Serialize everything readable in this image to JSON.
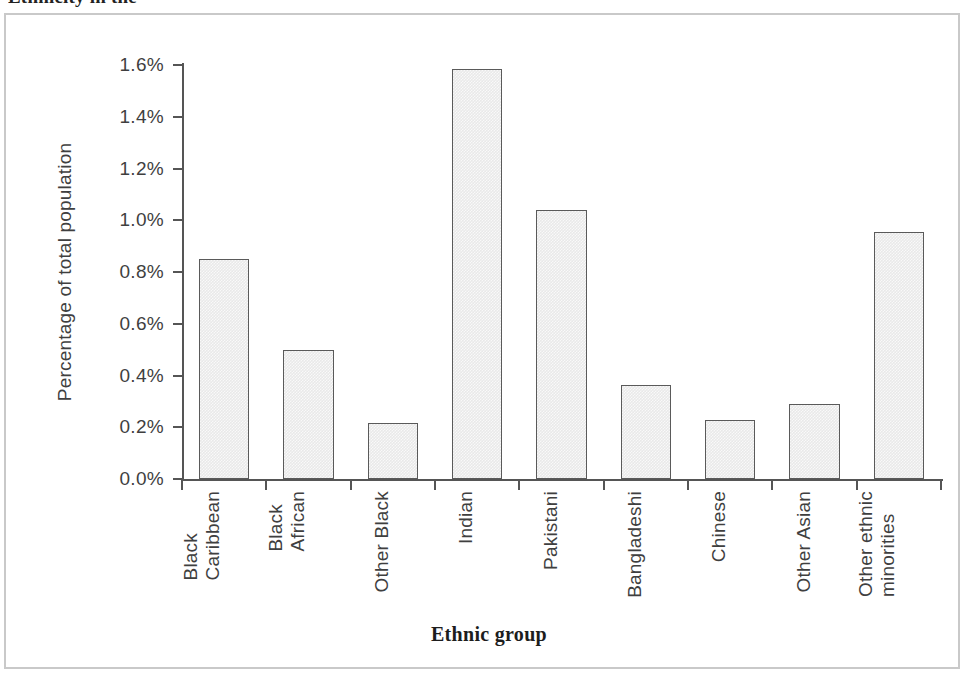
{
  "page": {
    "clipped_heading": "Ethnicity in the"
  },
  "chart_data": {
    "type": "bar",
    "title": "",
    "xlabel": "Ethnic group",
    "ylabel": "Percentage of total population",
    "categories": [
      "Black Caribbean",
      "Black African",
      "Other Black",
      "Indian",
      "Pakistani",
      "Bangladeshi",
      "Chinese",
      "Other Asian",
      "Other ethnic minorities"
    ],
    "category_lines": [
      [
        "Black",
        "Caribbean"
      ],
      [
        "Black",
        "African"
      ],
      [
        "Other Black"
      ],
      [
        "Indian"
      ],
      [
        "Pakistani"
      ],
      [
        "Bangladeshi"
      ],
      [
        "Chinese"
      ],
      [
        "Other Asian"
      ],
      [
        "Other ethnic",
        "minorities"
      ]
    ],
    "values": [
      0.85,
      0.5,
      0.215,
      1.585,
      1.04,
      0.365,
      0.23,
      0.29,
      0.955
    ],
    "value_labels": [
      "0.85%",
      "0.50%",
      "0.22%",
      "1.59%",
      "1.04%",
      "0.37%",
      "0.23%",
      "0.29%",
      "0.96%"
    ],
    "ylim": [
      0.0,
      1.6
    ],
    "ytick_values": [
      0.0,
      0.2,
      0.4,
      0.6,
      0.8,
      1.0,
      1.2,
      1.4,
      1.6
    ],
    "ytick_labels": [
      "0.0%",
      "0.2%",
      "0.4%",
      "0.6%",
      "0.8%",
      "1.0%",
      "1.2%",
      "1.4%",
      "1.6%"
    ],
    "grid": false,
    "legend": "none",
    "bar_fill_color": "#e9e9e9",
    "bar_border_color": "#5a5a5a",
    "axis_color": "#555555",
    "frame_color": "#c9c9c9"
  }
}
